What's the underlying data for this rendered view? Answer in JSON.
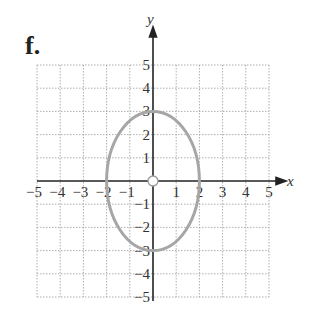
{
  "panel_label": "f.",
  "chart_data": {
    "type": "line",
    "title": "",
    "xlabel": "x",
    "ylabel": "y",
    "xlim": [
      -5,
      5
    ],
    "ylim": [
      -5,
      5
    ],
    "grid": true,
    "x_ticks": [
      "−5",
      "−4",
      "−3",
      "−2",
      "−1",
      "1",
      "2",
      "3",
      "4",
      "5"
    ],
    "y_ticks": [
      "5",
      "4",
      "3",
      "2",
      "1",
      "−1",
      "−2",
      "−3",
      "−4",
      "−5"
    ],
    "series": [
      {
        "name": "ellipse",
        "shape": "ellipse",
        "center": [
          0,
          0
        ],
        "semi_axis_x": 2,
        "semi_axis_y": 3,
        "equation": "x^2/4 + y^2/9 = 1",
        "color": "#a6a6a6"
      }
    ],
    "annotations": [
      {
        "type": "open-circle",
        "at": [
          0,
          0
        ],
        "meaning": "center (not on graph)"
      }
    ]
  },
  "colors": {
    "curve": "#a6a6a6",
    "axis": "#222222",
    "grid": "#9a9a9a"
  }
}
